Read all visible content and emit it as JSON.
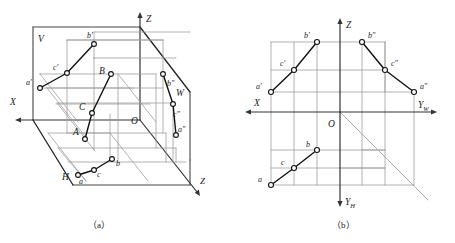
{
  "figure": {
    "colors": {
      "object_line": "#111111",
      "projection_line": "#8f8f8f",
      "plane_edge": "#555555",
      "axis": "#333333",
      "text": "#1a1a1a",
      "marker_fill": "#ffffff",
      "background": "#ffffff"
    },
    "captions": [
      {
        "id": "caption-a",
        "label": "（a）"
      },
      {
        "id": "caption-b",
        "label": "（b）"
      }
    ]
  },
  "panel_a": {
    "name": "axonometric-view",
    "axes": [
      {
        "id": "axis-x",
        "label": "X"
      },
      {
        "id": "axis-y",
        "label": "Y"
      },
      {
        "id": "axis-z",
        "label": "Z"
      }
    ],
    "origin_label": "O",
    "planes": [
      {
        "id": "plane-v",
        "label": "V"
      },
      {
        "id": "plane-h",
        "label": "H"
      },
      {
        "id": "plane-w",
        "label": "W"
      }
    ],
    "space_points": [
      {
        "id": "point-A",
        "label": "A"
      },
      {
        "id": "point-B",
        "label": "B"
      },
      {
        "id": "point-C",
        "label": "C"
      }
    ],
    "v_projections": [
      {
        "id": "point-a-prime",
        "label": "a′"
      },
      {
        "id": "point-b-prime",
        "label": "b′"
      },
      {
        "id": "point-c-prime",
        "label": "c′"
      }
    ],
    "h_projections": [
      {
        "id": "point-a-h",
        "label": "a"
      },
      {
        "id": "point-b-h",
        "label": "b"
      },
      {
        "id": "point-c-h",
        "label": "c"
      }
    ],
    "w_projections": [
      {
        "id": "point-a-dprime",
        "label": "a″"
      },
      {
        "id": "point-b-dprime",
        "label": "b″"
      },
      {
        "id": "point-c-dprime",
        "label": "c″"
      }
    ]
  },
  "panel_b": {
    "name": "orthographic-view",
    "axes": [
      {
        "id": "axis-x",
        "label": "X"
      },
      {
        "id": "axis-z",
        "label": "Z"
      },
      {
        "id": "axis-yw",
        "label": "Y",
        "sub": "W"
      },
      {
        "id": "axis-yh",
        "label": "Y",
        "sub": "H"
      }
    ],
    "origin_label": "O",
    "v_projections": [
      {
        "id": "point-a-prime",
        "label": "a′"
      },
      {
        "id": "point-b-prime",
        "label": "b′"
      },
      {
        "id": "point-c-prime",
        "label": "c′"
      }
    ],
    "h_projections": [
      {
        "id": "point-a-h",
        "label": "a"
      },
      {
        "id": "point-b-h",
        "label": "b"
      },
      {
        "id": "point-c-h",
        "label": "c"
      }
    ],
    "w_projections": [
      {
        "id": "point-a-dprime",
        "label": "a″"
      },
      {
        "id": "point-b-dprime",
        "label": "b″"
      },
      {
        "id": "point-c-dprime",
        "label": "c″"
      }
    ]
  }
}
